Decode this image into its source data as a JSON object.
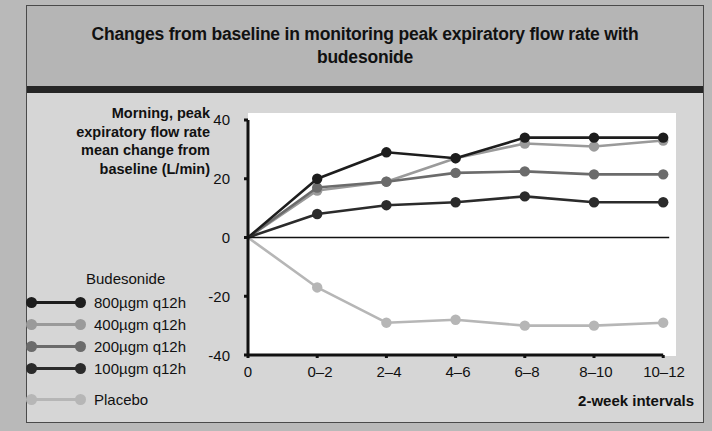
{
  "header": {
    "title": "Changes from baseline in monitoring peak expiratory flow rate with budesonide"
  },
  "axes": {
    "y_caption": "Morning, peak expiratory flow rate mean change from baseline (L/min)",
    "x_caption": "2-week intervals",
    "y_ticks": [
      "40",
      "20",
      "0",
      "-20",
      "-40"
    ],
    "x_ticks": [
      "0",
      "0–2",
      "2–4",
      "4–6",
      "6–8",
      "8–10",
      "10–12"
    ]
  },
  "legend": {
    "title": "Budesonide",
    "items": [
      {
        "label": "800µgm q12h",
        "color": "#1d1d1d"
      },
      {
        "label": "400µgm q12h",
        "color": "#9a9a9a"
      },
      {
        "label": "200µgm q12h",
        "color": "#6b6b6b"
      },
      {
        "label": "100µgm q12h",
        "color": "#2b2b2b"
      },
      {
        "label": "Placebo",
        "color": "#b6b6b6"
      }
    ]
  },
  "chart_data": {
    "type": "line",
    "title": "Changes from baseline in monitoring peak expiratory flow rate with budesonide",
    "xlabel": "2-week intervals",
    "ylabel": "Morning, peak expiratory flow rate mean change from baseline (L/min)",
    "categories": [
      "0",
      "0–2",
      "2–4",
      "4–6",
      "6–8",
      "8–10",
      "10–12"
    ],
    "ylim": [
      -40,
      40
    ],
    "yticks": [
      -40,
      -20,
      0,
      20,
      40
    ],
    "grid": false,
    "legend_position": "left",
    "zero_line": true,
    "series": [
      {
        "name": "800µgm q12h",
        "color": "#1d1d1d",
        "values": [
          0,
          20,
          29,
          27,
          34,
          34,
          34
        ]
      },
      {
        "name": "400µgm q12h",
        "color": "#9a9a9a",
        "values": [
          0,
          16,
          19,
          27,
          32,
          31,
          33
        ]
      },
      {
        "name": "200µgm q12h",
        "color": "#6b6b6b",
        "values": [
          0,
          17,
          19,
          22,
          22.5,
          21.5,
          21.5
        ]
      },
      {
        "name": "100µgm q12h",
        "color": "#2b2b2b",
        "values": [
          0,
          8,
          11,
          12,
          14,
          12,
          12
        ]
      },
      {
        "name": "Placebo",
        "color": "#b6b6b6",
        "values": [
          0,
          -17,
          -29,
          -28,
          -30,
          -30,
          -29
        ]
      }
    ]
  }
}
